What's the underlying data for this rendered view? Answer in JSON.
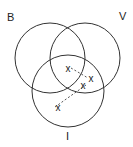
{
  "diagram": {
    "type": "venn",
    "sets": [
      {
        "label": "B",
        "cx": 50,
        "cy": 58,
        "r": 35,
        "label_x": 7,
        "label_y": 21
      },
      {
        "label": "V",
        "cx": 85,
        "cy": 58,
        "r": 35,
        "label_x": 119,
        "label_y": 20
      },
      {
        "label": "I",
        "cx": 68,
        "cy": 91,
        "r": 36,
        "label_x": 66,
        "label_y": 140
      }
    ],
    "points": [
      {
        "label": "x",
        "x": 68,
        "y": 68
      },
      {
        "label": "x",
        "x": 91,
        "y": 78
      },
      {
        "label": "x",
        "x": 83,
        "y": 85
      },
      {
        "label": "x",
        "x": 58,
        "y": 107
      }
    ],
    "dashed_links": [
      {
        "from": 0,
        "to": 1
      },
      {
        "from": 2,
        "to": 3
      }
    ]
  }
}
